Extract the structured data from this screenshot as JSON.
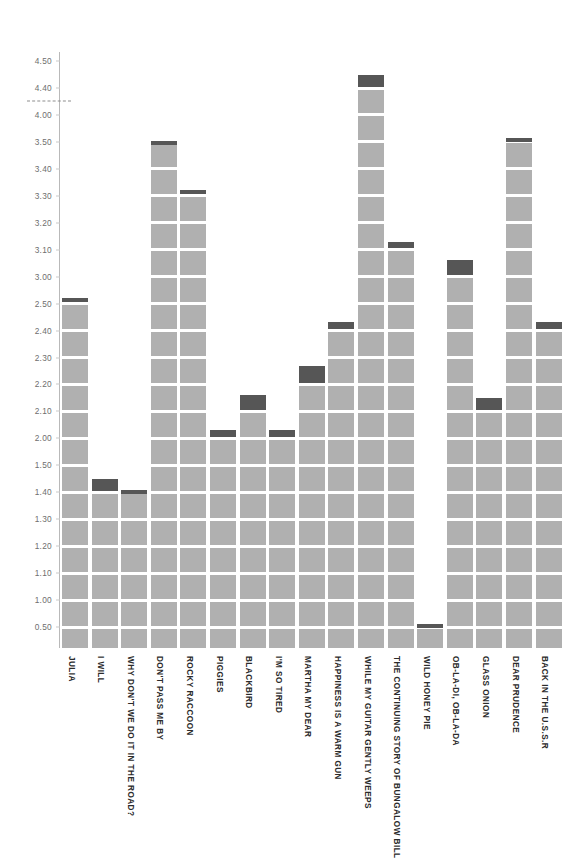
{
  "chart_data": {
    "type": "bar",
    "title": "",
    "subtitle": "",
    "xlabel": "",
    "ylabel": "",
    "grid": false,
    "legend": null,
    "orientation": "vertical",
    "bar_color": "#b0b0b0",
    "bar_cap_color": "#565656",
    "axis_color": "#b9b9b9",
    "tick_label_color": "#6e6e6e",
    "category_label_color": "#2b2b2b",
    "axis_tick_labels": [
      "0.50",
      "1.00",
      "1.10",
      "1.20",
      "1.30",
      "1.40",
      "1.50",
      "2.00",
      "2.10",
      "2.20",
      "2.30",
      "2.40",
      "2.50",
      "3.00",
      "3.10",
      "3.20",
      "3.30",
      "3.40",
      "3.50",
      "4.00",
      "4.40",
      "4.50"
    ],
    "axis_tick_values": [
      0.5,
      1.0,
      1.1,
      1.2,
      1.3,
      1.4,
      1.5,
      2.0,
      2.1,
      2.2,
      2.3,
      2.4,
      2.5,
      3.0,
      3.1,
      3.2,
      3.3,
      3.4,
      3.5,
      4.0,
      4.4,
      4.5
    ],
    "threshold_line": {
      "label": "",
      "between": [
        "4.40",
        "4.00"
      ],
      "style": "dashed",
      "color": "#8d8d8d"
    },
    "categories": [
      "JULIA",
      "I WILL",
      "WHY DON'T WE DO IT IN THE ROAD?",
      "DON'T PASS ME BY",
      "ROCKY RACCOON",
      "PIGGIES",
      "BLACKBIRD",
      "I'M SO TIRED",
      "MARTHA MY DEAR",
      "HAPPINESS IS A WARM GUN",
      "WHILE MY GUITAR GENTLY WEEPS",
      "THE CONTINUING STORY OF BUNGALOW BILL",
      "WILD HONEY PIE",
      "OB-LA-DI, OB-LA-DA",
      "GLASS ONION",
      "DEAR PRUDENCE",
      "BACK IN THE U.S.S.R"
    ],
    "values": [
      2.6,
      1.45,
      1.41,
      3.52,
      3.32,
      2.03,
      2.16,
      2.03,
      2.27,
      2.43,
      4.45,
      3.13,
      0.55,
      3.06,
      2.15,
      3.58,
      2.43
    ]
  }
}
